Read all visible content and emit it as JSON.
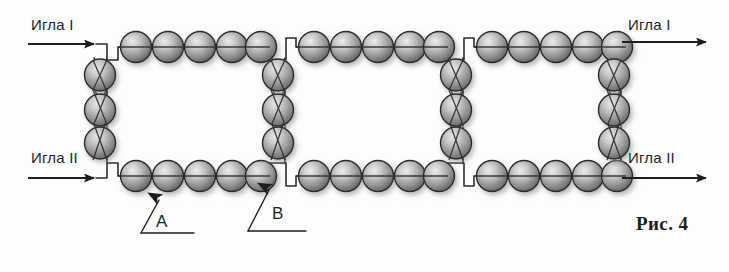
{
  "figure": {
    "caption": "Рис. 4",
    "background_color": "#fdfdfd",
    "ink_color": "#1d1d1d"
  },
  "labels": {
    "needle_1_left": "Игла I",
    "needle_2_left": "Игла II",
    "needle_1_right": "Игла I",
    "needle_2_right": "Игла II",
    "callout_a": "A",
    "callout_b": "B"
  },
  "bead": {
    "fill_light": "#d8d8d8",
    "fill_mid": "#9a9a9a",
    "fill_dark": "#5e5e5e",
    "outline": "#2a2a2a",
    "shadow": "#b5b5b5",
    "radius_x": 15,
    "radius_y": 15,
    "count_total": 42
  },
  "diagram_data": {
    "type": "bead-weaving-schematic",
    "cells": 3,
    "beads_per_horizontal_run": 5,
    "beads_per_vertical_column": 3,
    "top_row_y": 47,
    "bottom_row_y": 176,
    "thread_color": "#2a2a2a",
    "thread_width": 1.6,
    "vertical_columns_x": [
      100,
      278,
      456,
      614
    ],
    "horizontal_runs": [
      {
        "name": "top-run-1",
        "y": 47,
        "x_start": 122,
        "x_end": 266,
        "beads": 5
      },
      {
        "name": "top-run-2",
        "y": 47,
        "x_start": 300,
        "x_end": 444,
        "beads": 5
      },
      {
        "name": "top-run-3",
        "y": 47,
        "x_start": 478,
        "x_end": 622,
        "beads": 5
      },
      {
        "name": "bottom-run-1",
        "y": 176,
        "x_start": 122,
        "x_end": 266,
        "beads": 5
      },
      {
        "name": "bottom-run-2",
        "y": 176,
        "x_start": 300,
        "x_end": 444,
        "beads": 5
      },
      {
        "name": "bottom-run-3",
        "y": 176,
        "x_start": 478,
        "x_end": 622,
        "beads": 5
      }
    ],
    "vertical_runs": [
      {
        "name": "col-1",
        "x": 100,
        "y_start": 75,
        "y_end": 147,
        "beads": 3
      },
      {
        "name": "col-2",
        "x": 278,
        "y_start": 75,
        "y_end": 147,
        "beads": 3
      },
      {
        "name": "col-3",
        "x": 456,
        "y_start": 75,
        "y_end": 147,
        "beads": 3
      },
      {
        "name": "col-4",
        "x": 614,
        "y_start": 75,
        "y_end": 147,
        "beads": 3
      }
    ],
    "arrows": [
      {
        "name": "needle-1-in",
        "x1": 28,
        "y1": 44,
        "x2": 96,
        "y2": 44,
        "direction": "right"
      },
      {
        "name": "needle-2-in",
        "x1": 28,
        "y1": 178,
        "x2": 96,
        "y2": 178,
        "direction": "right"
      },
      {
        "name": "needle-1-out",
        "x1": 620,
        "y1": 42,
        "x2": 706,
        "y2": 42,
        "direction": "right"
      },
      {
        "name": "needle-2-out",
        "x1": 620,
        "y1": 178,
        "x2": 706,
        "y2": 178,
        "direction": "right"
      }
    ],
    "callout_leaders": [
      {
        "name": "leader-a",
        "tip_x": 162,
        "tip_y": 196,
        "bend_x": 141,
        "bend_y": 233,
        "end_x": 194,
        "end_y": 233
      },
      {
        "name": "leader-b",
        "tip_x": 272,
        "tip_y": 186,
        "bend_x": 248,
        "bend_y": 231,
        "end_x": 306,
        "end_y": 231
      }
    ]
  }
}
